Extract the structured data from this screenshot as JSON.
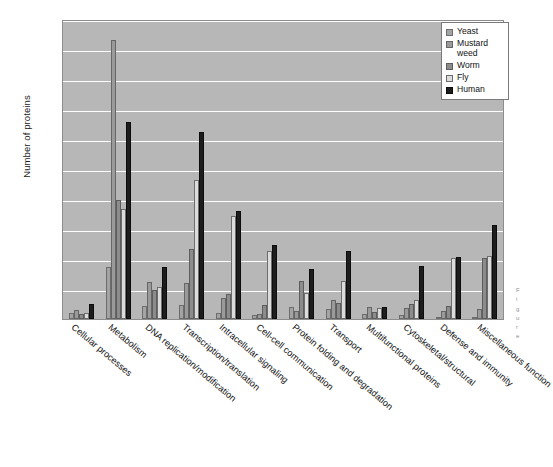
{
  "chart_data": {
    "type": "bar",
    "title": "",
    "xlabel": "",
    "ylabel": "Number of proteins",
    "ylim": [
      0,
      5000
    ],
    "ytick_labels": [
      "5000",
      "4500",
      "4000",
      "3500",
      "3000",
      "2500",
      "2000",
      "1500",
      "1000",
      "500",
      "0"
    ],
    "ytick_values": [
      5000,
      4500,
      4000,
      3500,
      3000,
      2500,
      2000,
      1500,
      1000,
      500,
      0
    ],
    "grid": true,
    "legend_position": "top-right",
    "categories": [
      "Cellular processes",
      "Metabolism",
      "DNA replication/modification",
      "Transcription/translation",
      "Intracellular signaling",
      "Cell-cell communication",
      "Protein folding and degradation",
      "Transport",
      "Multifunctional proteins",
      "Cytoskeletal/structural",
      "Defense and immunity",
      "Miscellaneous function"
    ],
    "series": [
      {
        "name": "Yeast",
        "values": [
          100,
          870,
          220,
          230,
          100,
          60,
          200,
          160,
          90,
          70,
          40,
          40
        ]
      },
      {
        "name": "Mustard weed",
        "values": [
          150,
          4650,
          620,
          600,
          350,
          90,
          130,
          320,
          200,
          180,
          140,
          170
        ]
      },
      {
        "name": "Worm",
        "values": [
          90,
          1980,
          480,
          1160,
          420,
          230,
          640,
          270,
          120,
          250,
          220,
          1020
        ]
      },
      {
        "name": "Fly",
        "values": [
          95,
          1830,
          530,
          2310,
          1710,
          1130,
          430,
          640,
          180,
          310,
          1010,
          1050
        ]
      },
      {
        "name": "Human",
        "values": [
          250,
          3280,
          860,
          3110,
          1800,
          1240,
          840,
          1140,
          200,
          880,
          1030,
          1570
        ]
      }
    ],
    "series_colors": [
      "#a3a3a3",
      "#9a9a9a",
      "#8c8c8c",
      "#dcdcdc",
      "#1d1d1d"
    ],
    "plot_background": "#b7b7b7",
    "gridline_color": "#ffffff"
  },
  "legend": {
    "items": [
      "Yeast",
      "Mustard weed",
      "Worm",
      "Fly",
      "Human"
    ]
  },
  "caption": {
    "lines": [
      "F",
      "i",
      "g",
      "u",
      "r",
      "e"
    ]
  }
}
